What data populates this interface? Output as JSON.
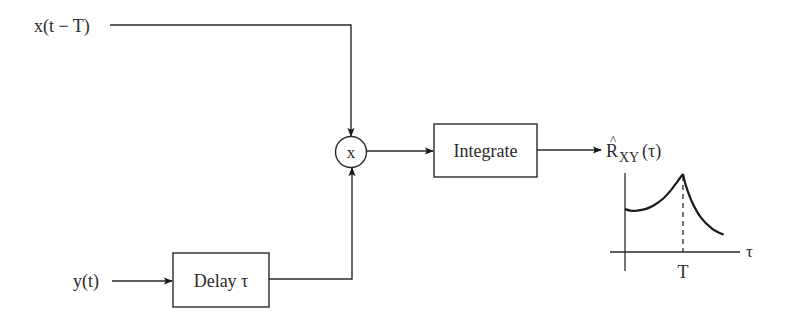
{
  "inputs": {
    "x_input": "x(t − T)",
    "y_input": "y(t)"
  },
  "blocks": {
    "multiplier": "x",
    "integrator": "Integrate",
    "delay": "Delay τ"
  },
  "output": {
    "label_main": "R",
    "label_hat": "^",
    "label_sub": "XY",
    "label_arg": "(τ)"
  },
  "plot": {
    "x_axis_label": "τ",
    "peak_tick_label": "T",
    "description": "Estimated cross-correlation with peak at τ = T"
  },
  "chart_data": {
    "type": "line",
    "title": "",
    "xlabel": "τ",
    "ylabel": "R̂XY(τ)",
    "x_ticks": [
      "T"
    ],
    "peak_at": "T",
    "series": [
      {
        "name": "R_XY(tau)",
        "x": [
          0,
          0.1,
          0.2,
          0.35,
          0.5,
          0.65,
          0.8,
          0.9,
          1.0,
          1.05,
          1.15,
          1.3,
          1.5,
          1.7
        ],
        "values": [
          0.55,
          0.53,
          0.53,
          0.55,
          0.6,
          0.68,
          0.8,
          0.9,
          1.0,
          0.85,
          0.65,
          0.45,
          0.3,
          0.22
        ]
      }
    ],
    "grid": false
  }
}
